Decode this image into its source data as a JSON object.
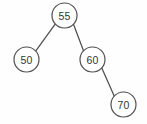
{
  "diagram": {
    "kind": "binary-search-tree",
    "background_color": "#fefefe",
    "stroke_color": "#4f4f4f",
    "text_color": "#333333",
    "node_radius": 12.5,
    "nodes": [
      {
        "id": "n55",
        "label": "55",
        "cx": 64.5,
        "cy": 15.5,
        "role": "root"
      },
      {
        "id": "n50",
        "label": "50",
        "cx": 26.5,
        "cy": 59.5,
        "role": "left-child"
      },
      {
        "id": "n60",
        "label": "60",
        "cx": 92.5,
        "cy": 59.5,
        "role": "right-child"
      },
      {
        "id": "n70",
        "label": "70",
        "cx": 123.5,
        "cy": 104.5,
        "role": "right-child"
      }
    ],
    "edges": [
      {
        "id": "e55-50",
        "from": "n55",
        "to": "n50",
        "x1": 55.0,
        "y1": 24.3,
        "x2": 36.0,
        "y2": 50.7
      },
      {
        "id": "e55-60",
        "from": "n55",
        "to": "n60",
        "x1": 73.4,
        "y1": 24.0,
        "x2": 83.6,
        "y2": 51.0
      },
      {
        "id": "e60-70",
        "from": "n60",
        "to": "n70",
        "x1": 101.8,
        "y1": 68.1,
        "x2": 114.2,
        "y2": 95.9
      }
    ]
  }
}
